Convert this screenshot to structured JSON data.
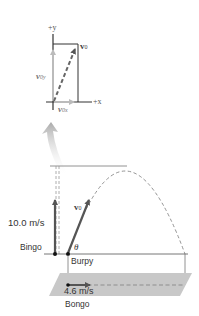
{
  "inset": {
    "axis_y_label": "+y",
    "axis_x_label": "+x",
    "vector_label": "v",
    "vector_sub": "0",
    "component_y_label": "v",
    "component_y_sub": "0y",
    "component_x_label": "v",
    "component_x_sub": "0x"
  },
  "main": {
    "bingo_speed": "10.0 m/s",
    "bingo_label": "Bingo",
    "burpy_label": "Burpy",
    "launch_vector_label": "v",
    "launch_vector_sub": "0",
    "angle_label": "θ",
    "bongo_speed": "4.6 m/s",
    "bongo_label": "Bongo"
  },
  "colors": {
    "vector_dark": "#555555",
    "component_light": "#bbbbbb",
    "trajectory": "#888888",
    "ground_plane": "#c8c8c8",
    "line": "#555555"
  }
}
